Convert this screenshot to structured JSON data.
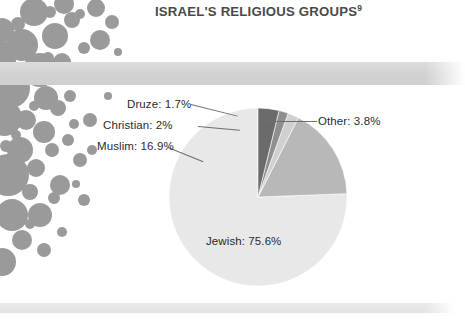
{
  "header": {
    "title": "ISRAEL'S RELIGIOUS GROUPS",
    "footnote_marker": "9"
  },
  "colors": {
    "title_band": "#d4d4d4",
    "title_text": "#4a4a4a",
    "footer_bar": "#e6e6e6",
    "bubble": "#9a9a9a",
    "slice_jewish": "#e8e8e8",
    "slice_muslim": "#b8b8b8",
    "slice_christian": "#d0d0d0",
    "slice_druze": "#8f8f8f",
    "slice_other": "#6b6b6b",
    "leader_line": "#6e6e6e",
    "label_text": "#2b2b2b",
    "page_background": "#ffffff"
  },
  "labels": {
    "druze": "Druze: 1.7%",
    "christian": "Christian: 2%",
    "muslim": "Muslim: 16.9%",
    "other": "Other: 3.8%",
    "jewish": "Jewish: 75.6%"
  },
  "chart_data": {
    "type": "pie",
    "title": "ISRAEL'S RELIGIOUS GROUPS",
    "units": "percent",
    "start_angle_deg": 0,
    "direction": "counterclockwise",
    "legend": "none",
    "labels_inline": true,
    "categories": [
      "Jewish",
      "Muslim",
      "Christian",
      "Druze",
      "Other"
    ],
    "values": [
      75.6,
      16.9,
      2.0,
      1.7,
      3.8
    ],
    "slices": [
      {
        "name": "Jewish",
        "value": 75.6,
        "label": "Jewish: 75.6%",
        "color": "#e8e8e8"
      },
      {
        "name": "Muslim",
        "value": 16.9,
        "label": "Muslim: 16.9%",
        "color": "#b8b8b8"
      },
      {
        "name": "Christian",
        "value": 2.0,
        "label": "Christian: 2%",
        "color": "#d0d0d0"
      },
      {
        "name": "Druze",
        "value": 1.7,
        "label": "Druze: 1.7%",
        "color": "#8f8f8f"
      },
      {
        "name": "Other",
        "value": 3.8,
        "label": "Other: 3.8%",
        "color": "#6b6b6b"
      }
    ]
  }
}
